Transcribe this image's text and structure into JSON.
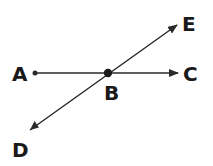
{
  "diagram": {
    "type": "geometry-lines",
    "colors": {
      "stroke": "#2a2a2a",
      "text": "#1a1a1a",
      "background": "#ffffff"
    },
    "points": {
      "A": {
        "label": "A",
        "x": 35,
        "y": 73
      },
      "B": {
        "label": "B",
        "x": 108,
        "y": 73
      },
      "C": {
        "label": "C",
        "x": 178,
        "y": 73
      },
      "D": {
        "label": "D",
        "x": 30,
        "y": 130
      },
      "E": {
        "label": "E",
        "x": 177,
        "y": 25
      }
    },
    "labels": {
      "A": "A",
      "B": "B",
      "C": "C",
      "D": "D",
      "E": "E"
    },
    "segments": [
      {
        "from": "A",
        "to": "C",
        "arrow_end": "C",
        "name": "ray-ac"
      },
      {
        "from": "D",
        "to": "E",
        "arrow_ends": [
          "D",
          "E"
        ],
        "name": "line-de"
      }
    ]
  }
}
